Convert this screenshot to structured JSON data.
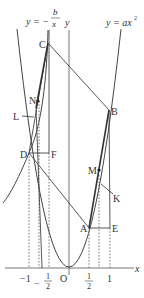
{
  "diagram": {
    "curve_labels": {
      "hyperbola_prefix": "y = −",
      "hyperbola_num": "b",
      "hyperbola_den": "x",
      "parabola": "y = ax",
      "parabola_exp": "2"
    },
    "axis_labels": {
      "y": "y",
      "x": "x",
      "origin": "O"
    },
    "ticks": {
      "neg_one": "−1",
      "neg_half_sign": "−",
      "neg_half_num": "1",
      "neg_half_den": "2",
      "half_num": "1",
      "half_den": "2",
      "one": "1"
    },
    "points": {
      "A": "A",
      "B": "B",
      "C": "C",
      "D": "D",
      "E": "E",
      "F": "F",
      "K": "K",
      "L": "L",
      "M": "M",
      "N": "N"
    }
  }
}
